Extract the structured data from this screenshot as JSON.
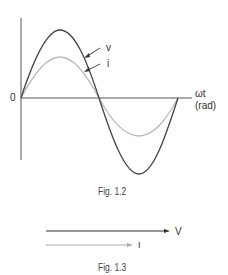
{
  "figure_1_2": {
    "caption": "Fig. 1.2",
    "origin_label": "0",
    "x_axis_label_line1": "ωt",
    "x_axis_label_line2": "(rad)",
    "voltage_label": "v",
    "current_label": "i",
    "colors": {
      "voltage": "#444444",
      "current": "#bbbbbb",
      "axis": "#555555"
    }
  },
  "figure_1_3": {
    "caption": "Fig. 1.3",
    "voltage_phasor_label": "V",
    "current_phasor_label": "I"
  }
}
